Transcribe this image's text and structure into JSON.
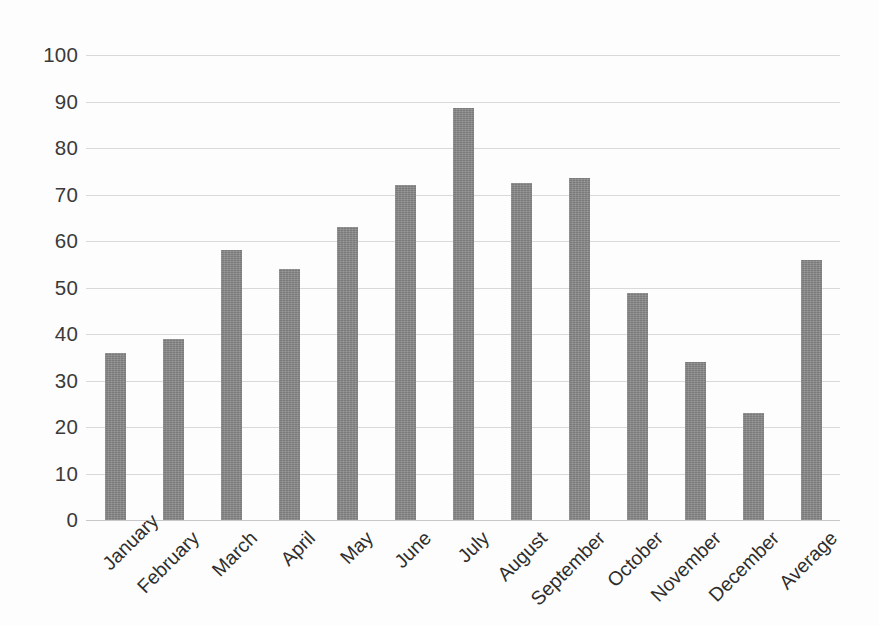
{
  "chart_data": {
    "type": "bar",
    "title": "",
    "subtitle": "",
    "xlabel": "",
    "ylabel": "",
    "categories": [
      "January",
      "February",
      "March",
      "April",
      "May",
      "June",
      "July",
      "August",
      "September",
      "October",
      "November",
      "December",
      "Average"
    ],
    "values": [
      36,
      39,
      58,
      54,
      63,
      72,
      88.5,
      72.5,
      73.5,
      48.8,
      34,
      23,
      56
    ],
    "series": [
      {
        "name": "",
        "values": [
          36,
          39,
          58,
          54,
          63,
          72,
          88.5,
          72.5,
          73.5,
          48.8,
          34,
          23,
          56
        ]
      }
    ],
    "ylim": [
      0,
      100
    ],
    "ytick_labels": [
      "0",
      "10",
      "20",
      "30",
      "40",
      "50",
      "60",
      "70",
      "80",
      "90",
      "100"
    ],
    "ytick_values": [
      0,
      10,
      20,
      30,
      40,
      50,
      60,
      70,
      80,
      90,
      100
    ],
    "grid": "horizontal",
    "legend": "none",
    "bar_color": "#848484",
    "gridline_color": "#d9d9d9",
    "background_color": "#ffffff",
    "text_color": "#2e2e2e",
    "xtick_label_rotation": -45
  }
}
